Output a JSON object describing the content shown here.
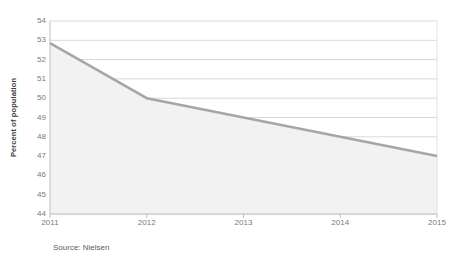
{
  "chart_data": {
    "type": "area",
    "title": "",
    "xlabel": "",
    "ylabel": "Percent of population",
    "categories": [
      "2011",
      "2012",
      "2013",
      "2014",
      "2015"
    ],
    "values": [
      52.85,
      50,
      49,
      48,
      47
    ],
    "series": [
      {
        "name": "Percent of population",
        "values": [
          52.85,
          50,
          49,
          48,
          47
        ]
      }
    ],
    "ylim": [
      44,
      54
    ],
    "ytick_step": 1,
    "yticks": [
      44,
      45,
      46,
      47,
      48,
      49,
      50,
      51,
      52,
      53,
      54
    ],
    "ytick_labels": [
      "44",
      "45",
      "46",
      "47",
      "48",
      "49",
      "50",
      "51",
      "52",
      "53",
      "54"
    ],
    "xticks": [
      "2011",
      "2012",
      "2013",
      "2014",
      "2015"
    ],
    "grid": "horizontal",
    "legend": "none",
    "annotations": [
      "Source: Nielsen"
    ],
    "colors": {
      "line": "#a6a6a6",
      "fill": "#f2f2f2",
      "grid": "#d9d9d9",
      "axis": "#bfbfbf",
      "tick_text": "#7a7a7a",
      "axis_title_text": "#3a3a3a",
      "source_text": "#5d5d5d",
      "background": "#ffffff"
    }
  },
  "footer": {
    "source": "Source: Nielsen"
  }
}
